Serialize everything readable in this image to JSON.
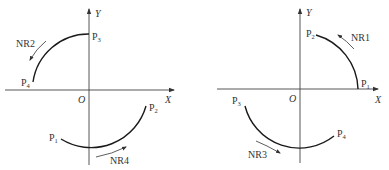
{
  "diagram": {
    "type": "circular interpolation direction illustration",
    "colors": {
      "stroke": "#1a1a1a",
      "axis": "#444444",
      "text": "#333333",
      "background": "#ffffff"
    },
    "panels": [
      {
        "id": "left",
        "axis_x_label": "X",
        "axis_y_label": "Y",
        "origin_label": "O",
        "arcs": [
          {
            "name": "NR2",
            "label": "NR2",
            "from": "P3",
            "to": "P4",
            "quadrant": "II",
            "direction": "counterclockwise"
          },
          {
            "name": "NR4",
            "label": "NR4",
            "from": "P1",
            "to": "P2",
            "quadrant": "III-IV",
            "direction": "counterclockwise"
          }
        ],
        "points": [
          {
            "base": "P",
            "sub": "3"
          },
          {
            "base": "P",
            "sub": "4"
          },
          {
            "base": "P",
            "sub": "1"
          },
          {
            "base": "P",
            "sub": "2"
          }
        ]
      },
      {
        "id": "right",
        "axis_x_label": "X",
        "axis_y_label": "Y",
        "origin_label": "O",
        "arcs": [
          {
            "name": "NR1",
            "label": "NR1",
            "from": "P1",
            "to": "P2",
            "quadrant": "I",
            "direction": "counterclockwise"
          },
          {
            "name": "NR3",
            "label": "NR3",
            "from": "P3",
            "to": "P4",
            "quadrant": "III-IV",
            "direction": "counterclockwise"
          }
        ],
        "points": [
          {
            "base": "P",
            "sub": "2"
          },
          {
            "base": "P",
            "sub": "1"
          },
          {
            "base": "P",
            "sub": "3"
          },
          {
            "base": "P",
            "sub": "4"
          }
        ]
      }
    ]
  }
}
